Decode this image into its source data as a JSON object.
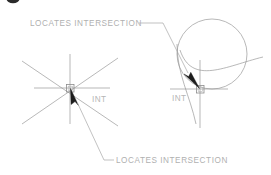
{
  "figure": {
    "type": "technical-cad-diagram",
    "background_color": "#ffffff",
    "line_color": "#9a9a9a",
    "text_color": "#b0b0b0",
    "cursor_color": "#1d1d1d",
    "callouts": {
      "top": {
        "text": "LOCATES  INTERSECTION",
        "x": 30,
        "y": 26
      },
      "bottom": {
        "text": "LOCATES  INTERSECTION",
        "x": 116,
        "y": 163
      }
    },
    "left_diagram": {
      "name": "intersection-of-lines",
      "snap_label": "INT",
      "snap_label_x": 92,
      "snap_label_y": 102,
      "intersection_x": 70,
      "intersection_y": 88
    },
    "right_diagram": {
      "name": "intersection-of-circle-arc-lines",
      "snap_label": "INT",
      "snap_label_x": 172,
      "snap_label_y": 101,
      "intersection_x": 200,
      "intersection_y": 89
    }
  }
}
